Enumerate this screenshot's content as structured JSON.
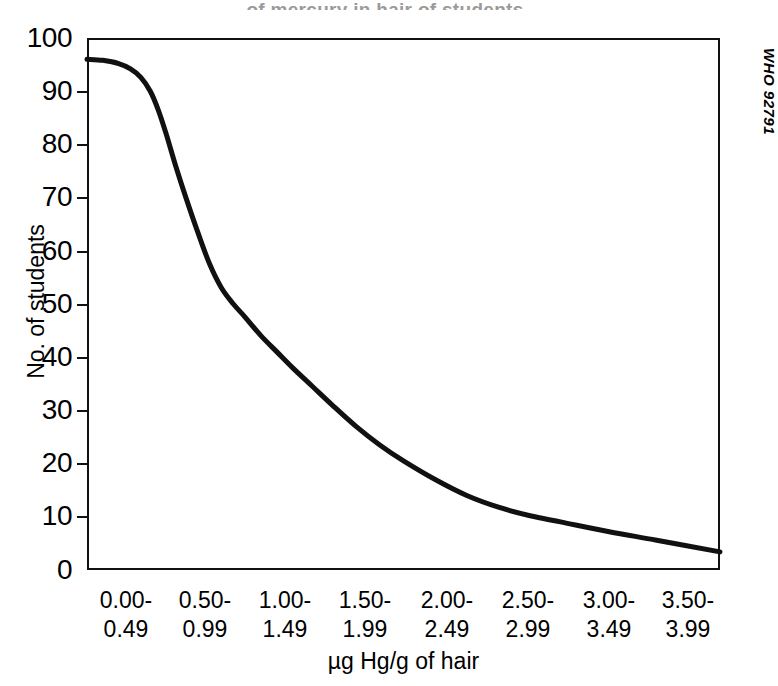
{
  "figure": {
    "title_remnant": "of mercury in hair of students",
    "source_code": "WHO 92791"
  },
  "chart_data": {
    "type": "line",
    "title": "",
    "subtitle": "",
    "xlabel": "µg Hg/g of hair",
    "ylabel": "No. of students",
    "grid": false,
    "legend": "none",
    "xlim": [
      0,
      8
    ],
    "ylim": [
      0,
      100
    ],
    "yticks": [
      0,
      10,
      20,
      30,
      40,
      50,
      60,
      70,
      80,
      90,
      100
    ],
    "ytick_labels": [
      "0",
      "10",
      "20",
      "30",
      "40",
      "50",
      "60",
      "70",
      "80",
      "90",
      "100"
    ],
    "categories": [
      "0.00-0.49",
      "0.50-0.99",
      "1.00-1.49",
      "1.50-1.99",
      "2.00-2.49",
      "2.50-2.99",
      "3.00-3.49",
      "3.50-3.99"
    ],
    "xtick_labels_line1": [
      "0.00-",
      "0.50-",
      "1.00-",
      "1.50-",
      "2.00-",
      "2.50-",
      "3.00-",
      "3.50-"
    ],
    "xtick_labels_line2": [
      "0.49",
      "0.99",
      "1.49",
      "1.99",
      "2.49",
      "2.99",
      "3.49",
      "3.99"
    ],
    "series": [
      {
        "name": "No. of students",
        "color": "#111111",
        "x": [
          0.0,
          0.2,
          0.4,
          0.55,
          0.68,
          0.8,
          0.9,
          1.0,
          1.12,
          1.25,
          1.4,
          1.55,
          1.7,
          1.85,
          2.0,
          2.2,
          2.4,
          2.6,
          2.85,
          3.1,
          3.4,
          3.7,
          4.0,
          4.4,
          4.8,
          5.2,
          5.6,
          6.0,
          6.6,
          7.2,
          8.0
        ],
        "y": [
          96.0,
          95.8,
          95.2,
          94.2,
          92.6,
          90.0,
          86.5,
          82.0,
          76.0,
          70.0,
          63.5,
          57.5,
          53.0,
          50.0,
          47.5,
          44.0,
          41.0,
          38.0,
          34.5,
          31.0,
          27.0,
          23.5,
          20.5,
          17.0,
          14.0,
          11.8,
          10.2,
          9.0,
          7.2,
          5.6,
          3.4
        ]
      }
    ],
    "annotations": [
      {
        "text": "WHO 92791",
        "position": "right-edge-vertical"
      }
    ]
  }
}
